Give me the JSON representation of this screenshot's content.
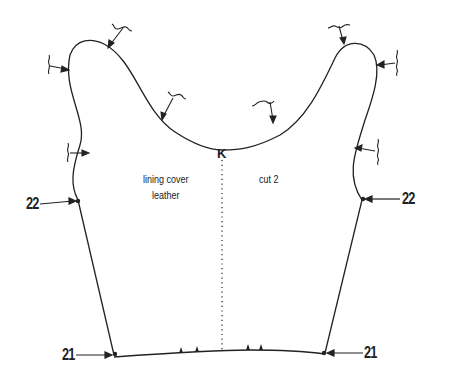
{
  "diagram": {
    "type": "sewing-pattern-piece",
    "labels": {
      "material_line1": "lining cover",
      "material_line2": "leather",
      "cut": "cut 2",
      "center_mark": "K",
      "point_22_left": "22",
      "point_22_right": "22",
      "point_21_left": "21",
      "point_21_right": "21"
    },
    "colors": {
      "line": "#222222",
      "background": "#ffffff"
    }
  }
}
